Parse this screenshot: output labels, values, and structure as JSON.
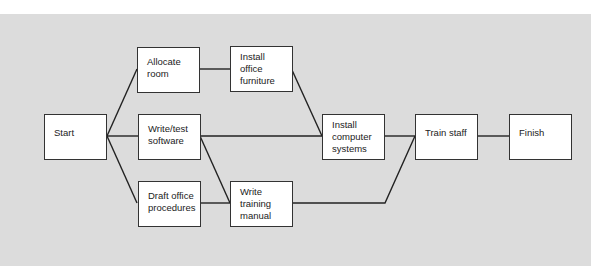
{
  "diagram": {
    "type": "network/precedence diagram",
    "background_color": "#dcdcdc",
    "node_border_color": "#333333",
    "nodes": [
      {
        "id": "start",
        "lines": [
          "Start"
        ]
      },
      {
        "id": "allocate_room",
        "lines": [
          "Allocate",
          "room"
        ]
      },
      {
        "id": "write_test_software",
        "lines": [
          "Write/test",
          "software"
        ]
      },
      {
        "id": "draft_office_procedures",
        "lines": [
          "Draft office",
          "procedures"
        ]
      },
      {
        "id": "install_office_furniture",
        "lines": [
          "Install",
          "office",
          "furniture"
        ]
      },
      {
        "id": "write_training_manual",
        "lines": [
          "Write",
          "training",
          "manual"
        ]
      },
      {
        "id": "install_computer_systems",
        "lines": [
          "Install",
          "computer",
          "systems"
        ]
      },
      {
        "id": "train_staff",
        "lines": [
          "Train staff"
        ]
      },
      {
        "id": "finish",
        "lines": [
          "Finish"
        ]
      }
    ],
    "edges": [
      {
        "from": "start",
        "to": "allocate_room"
      },
      {
        "from": "start",
        "to": "write_test_software"
      },
      {
        "from": "start",
        "to": "draft_office_procedures"
      },
      {
        "from": "allocate_room",
        "to": "install_office_furniture"
      },
      {
        "from": "install_office_furniture",
        "to": "install_computer_systems"
      },
      {
        "from": "write_test_software",
        "to": "install_computer_systems"
      },
      {
        "from": "write_test_software",
        "to": "write_training_manual"
      },
      {
        "from": "draft_office_procedures",
        "to": "write_training_manual"
      },
      {
        "from": "install_computer_systems",
        "to": "train_staff"
      },
      {
        "from": "write_training_manual",
        "to": "train_staff"
      },
      {
        "from": "train_staff",
        "to": "finish"
      }
    ]
  }
}
